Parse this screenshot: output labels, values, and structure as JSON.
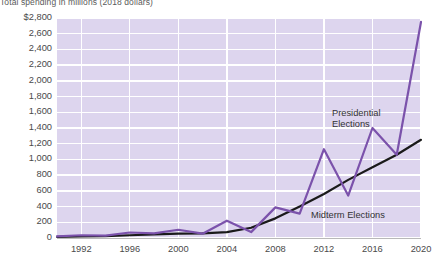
{
  "chart_data": {
    "type": "line",
    "title": "Total spending in millions (2018 dollars)",
    "xlabel": "",
    "ylabel": "",
    "xlim": [
      1990,
      2020
    ],
    "ylim": [
      0,
      2800
    ],
    "grid": true,
    "legend_position": "inline-annotations",
    "x_tick_labels": [
      "1992",
      "1996",
      "2000",
      "2004",
      "2008",
      "2012",
      "2016",
      "2020"
    ],
    "x_ticks": [
      1992,
      1996,
      2000,
      2004,
      2008,
      2012,
      2016,
      2020
    ],
    "y_tick_labels": [
      "$2,800",
      "2,600",
      "2,400",
      "2,200",
      "2,000",
      "1,800",
      "1,600",
      "1,400",
      "1,200",
      "1,000",
      "800",
      "600",
      "400",
      "200",
      "0"
    ],
    "y_ticks": [
      2800,
      2600,
      2400,
      2200,
      2000,
      1800,
      1600,
      1400,
      1200,
      1000,
      800,
      600,
      400,
      200,
      0
    ],
    "series": [
      {
        "name": "Presidential Elections",
        "color": "#7b52ab",
        "x": [
          1990,
          1992,
          1994,
          1996,
          1998,
          2000,
          2002,
          2004,
          2006,
          2008,
          2010,
          2012,
          2014,
          2016,
          2018,
          2020
        ],
        "values": [
          20,
          35,
          30,
          70,
          60,
          105,
          55,
          220,
          75,
          390,
          310,
          1130,
          540,
          1400,
          1060,
          2750
        ]
      },
      {
        "name": "Midterm Elections",
        "color": "#1a1a1a",
        "x": [
          1990,
          1992,
          1994,
          1996,
          1998,
          2000,
          2002,
          2004,
          2006,
          2008,
          2010,
          2012,
          2014,
          2016,
          2018,
          2020
        ],
        "values": [
          15,
          20,
          25,
          35,
          45,
          55,
          60,
          75,
          130,
          250,
          400,
          560,
          740,
          900,
          1060,
          1250
        ]
      }
    ],
    "annotations": [
      {
        "text": "Presidential",
        "series": "Presidential Elections"
      },
      {
        "text": "Elections",
        "series": "Presidential Elections"
      },
      {
        "text": "Midterm Elections",
        "series": "Midterm Elections"
      }
    ],
    "colors": {
      "plot_background": "#ddd5ee",
      "gridline": "#ffffff",
      "presidential_line": "#7b52ab",
      "midterm_line": "#1a1a1a",
      "axis_text": "#4a4a4a",
      "page_background": "#ffffff"
    }
  },
  "annotation_labels": {
    "presidential_line1": "Presidential",
    "presidential_line2": "Elections",
    "midterm": "Midterm Elections"
  }
}
